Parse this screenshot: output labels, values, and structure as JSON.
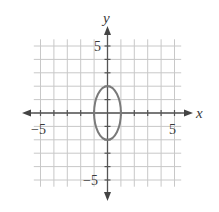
{
  "chart_data": {
    "type": "line",
    "title": "",
    "xlabel": "x",
    "ylabel": "y",
    "xlim": [
      -5,
      5
    ],
    "ylim": [
      -5,
      5
    ],
    "grid": true,
    "x_tick_labels": [
      "-5",
      "5"
    ],
    "y_tick_labels": [
      "5",
      "-5"
    ],
    "series": [
      {
        "name": "ellipse",
        "shape": "ellipse",
        "center": [
          0,
          0
        ],
        "semi_axis_x": 1,
        "semi_axis_y": 2,
        "equation": "x^2/1 + y^2/4 = 1",
        "color": "#7a7a7a"
      }
    ]
  },
  "labels": {
    "x_axis": "x",
    "y_axis": "y",
    "x_neg_tick": "−5",
    "x_pos_tick": "5",
    "y_pos_tick": "5",
    "y_neg_tick": "−5"
  },
  "colors": {
    "grid": "#c8c8c8",
    "axis": "#555555",
    "curve": "#7a7a7a"
  }
}
